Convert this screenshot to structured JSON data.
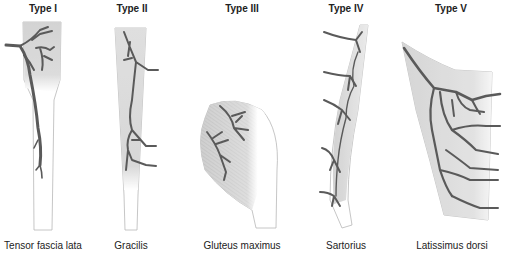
{
  "figure": {
    "panels": [
      {
        "type": "Type I",
        "muscle": "Tensor fascia lata",
        "center_x": 43
      },
      {
        "type": "Type II",
        "muscle": "Gracilis",
        "center_x": 132
      },
      {
        "type": "Type III",
        "muscle": "Gluteus maximus",
        "center_x": 242
      },
      {
        "type": "Type IV",
        "muscle": "Sartorius",
        "center_x": 346
      },
      {
        "type": "Type V",
        "muscle": "Latissimus dorsi",
        "center_x": 451
      }
    ]
  },
  "colors": {
    "vessel": "#5a5a5a",
    "muscle_shade": "#c8c8c8",
    "outline": "#b8b8b8",
    "text": "#222222",
    "background": "#ffffff"
  }
}
